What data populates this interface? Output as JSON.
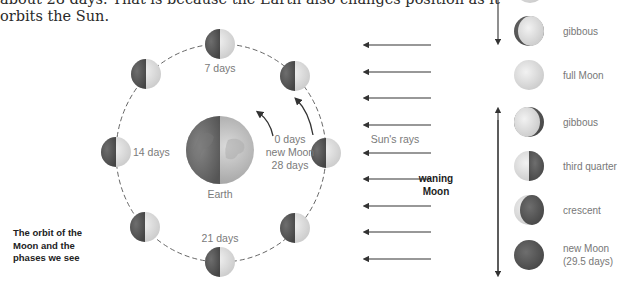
{
  "intro_text": {
    "line1": "about 28 days. That is because the Earth also changes position as it",
    "line2": "orbits the Sun."
  },
  "orbit": {
    "earth_label": "Earth",
    "labels": {
      "day7": "7 days",
      "day14": "14 days",
      "day21": "21 days",
      "day0_line1": "0 days",
      "day0_line2": "new Moon",
      "day0_line3": "28 days"
    },
    "caption": {
      "line1": "The orbit of the",
      "line2": "Moon and the",
      "line3": "phases we see"
    }
  },
  "sun_rays": {
    "label": "Sun's rays",
    "count": 9
  },
  "waning": {
    "line1": "waning",
    "line2": "Moon"
  },
  "phases": [
    {
      "name": "gibbous"
    },
    {
      "name": "full Moon"
    },
    {
      "name": "gibbous"
    },
    {
      "name": "third quarter"
    },
    {
      "name": "crescent"
    },
    {
      "name": "new Moon",
      "sub": "(29.5 days)"
    }
  ],
  "colors": {
    "moon_dark": "#5a5a5a",
    "moon_light": "#e4e4e4",
    "label_gray": "#7a7a7a",
    "arrow": "#333333"
  }
}
